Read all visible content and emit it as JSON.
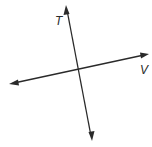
{
  "diagram": {
    "type": "intersecting-lines",
    "lines": [
      {
        "name": "T",
        "label": "T",
        "start": [
          92,
          141
        ],
        "end": [
          66,
          5
        ],
        "arrows": "both"
      },
      {
        "name": "V",
        "label": "V",
        "start": [
          9,
          84
        ],
        "end": [
          149,
          54
        ],
        "arrows": "both"
      }
    ],
    "intersection": [
      79,
      69
    ],
    "labels": {
      "t": {
        "text": "T",
        "x": 55,
        "y": 25
      },
      "v": {
        "text": "V",
        "x": 140,
        "y": 73
      }
    },
    "colors": {
      "line": "#2a2a2a",
      "background": "#ffffff"
    }
  }
}
